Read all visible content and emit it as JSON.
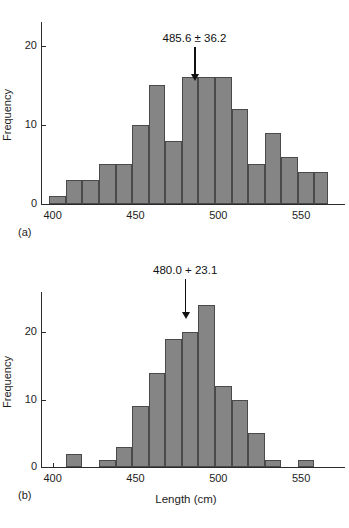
{
  "figure": {
    "background": "#ffffff",
    "bar_fill": "#858585",
    "bar_edge": "#4a4a4a",
    "axis_color": "#2b2b2b"
  },
  "chart_data": [
    {
      "type": "bar",
      "panel": "(a)",
      "title": "",
      "annotation": "485.6 ± 36.2",
      "annotation_value": 485.6,
      "annotation_error": 36.2,
      "xlabel": "",
      "ylabel": "Frequency",
      "xlim": [
        393,
        568
      ],
      "ylim": [
        0,
        23
      ],
      "xticks": [
        400,
        450,
        500,
        550
      ],
      "xticklabels": [
        "400",
        "450",
        "500",
        "550"
      ],
      "yticks": [
        0,
        10,
        20
      ],
      "yticklabels": [
        "0",
        "10",
        "20"
      ],
      "grid": false,
      "legend": "none",
      "bin_edges": [
        398,
        408,
        418,
        428,
        438,
        448,
        458,
        468,
        478,
        488,
        498,
        508,
        518,
        528,
        538,
        548,
        558,
        566
      ],
      "categories": [
        "398-408",
        "408-418",
        "418-428",
        "428-438",
        "438-448",
        "448-458",
        "458-468",
        "468-478",
        "478-488",
        "488-498",
        "498-508",
        "508-518",
        "518-528",
        "528-538",
        "538-548",
        "548-558",
        "558-566"
      ],
      "values": [
        1,
        3,
        3,
        5,
        5,
        10,
        15,
        8,
        16,
        16,
        16,
        12,
        5,
        9,
        6,
        4,
        4
      ]
    },
    {
      "type": "bar",
      "panel": "(b)",
      "title": "",
      "annotation": "480.0 + 23.1",
      "annotation_value": 480.0,
      "annotation_error": 23.1,
      "xlabel": "Length (cm)",
      "ylabel": "Frequency",
      "xlim": [
        393,
        568
      ],
      "ylim": [
        0,
        26
      ],
      "xticks": [
        400,
        450,
        500,
        550
      ],
      "xticklabels": [
        "400",
        "450",
        "500",
        "550"
      ],
      "yticks": [
        0,
        10,
        20
      ],
      "yticklabels": [
        "0",
        "10",
        "20"
      ],
      "grid": false,
      "legend": "none",
      "bin_edges": [
        398,
        408,
        418,
        428,
        438,
        448,
        458,
        468,
        478,
        488,
        498,
        508,
        518,
        528,
        538,
        548,
        558,
        566
      ],
      "categories": [
        "398-408",
        "408-418",
        "418-428",
        "428-438",
        "438-448",
        "448-458",
        "458-468",
        "468-478",
        "478-488",
        "488-498",
        "498-508",
        "508-518",
        "518-528",
        "528-538",
        "538-548",
        "548-558",
        "558-566"
      ],
      "values": [
        0,
        2,
        0,
        1,
        3,
        9,
        14,
        19,
        20,
        24,
        12,
        10,
        5,
        1,
        0,
        1,
        0
      ]
    }
  ]
}
